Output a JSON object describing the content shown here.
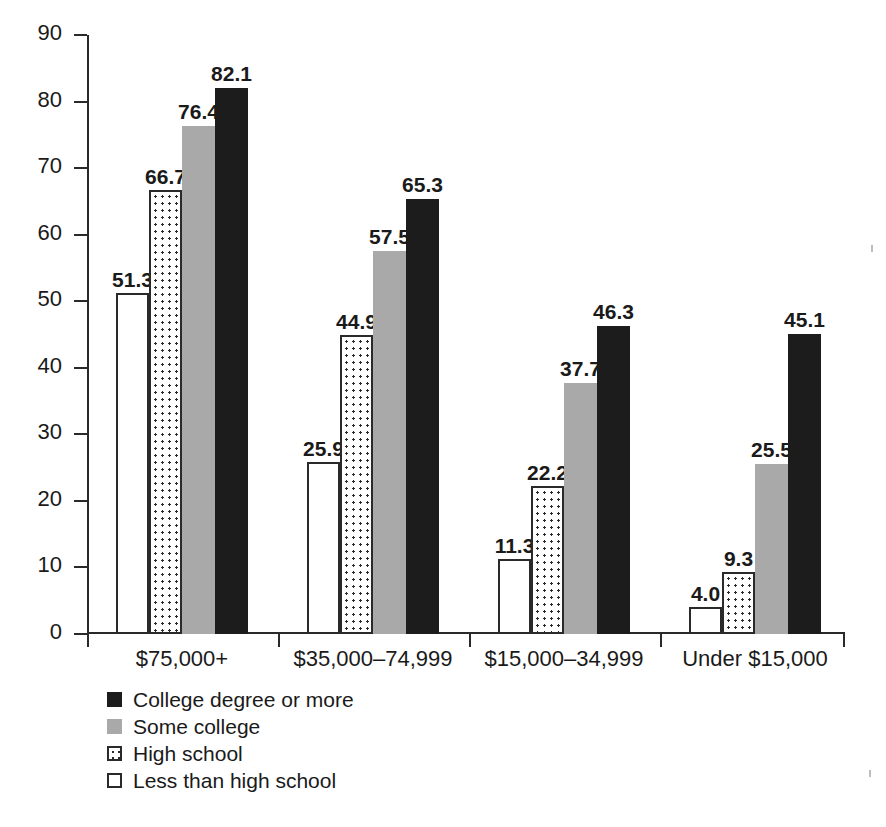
{
  "chart_data": {
    "type": "bar",
    "title": "",
    "subtitle": "",
    "xlabel": "",
    "ylabel": "",
    "ylim": [
      0,
      90
    ],
    "yticks": [
      0,
      10,
      20,
      30,
      40,
      50,
      60,
      70,
      80,
      90
    ],
    "grid": false,
    "legend_position": "bottom-left",
    "categories": [
      "$75,000+",
      "$35,000–74,999",
      "$15,000–34,999",
      "Under $15,000"
    ],
    "series": [
      {
        "name": "Less than high school",
        "swatch": "white-outline",
        "color": "#ffffff",
        "values": [
          51.3,
          25.9,
          11.3,
          4.0
        ],
        "labels": [
          "51.3",
          "25.9",
          "11.3",
          "4.0"
        ]
      },
      {
        "name": "High school",
        "swatch": "dotted",
        "color": "#ffffff",
        "values": [
          66.7,
          44.9,
          22.2,
          9.3
        ],
        "labels": [
          "66.7",
          "44.9",
          "22.2",
          "9.3"
        ]
      },
      {
        "name": "Some college",
        "swatch": "gray",
        "color": "#a9a9a9",
        "values": [
          76.4,
          57.5,
          37.7,
          25.5
        ],
        "labels": [
          "76.4",
          "57.5",
          "37.7",
          "25.5"
        ]
      },
      {
        "name": "College degree or more",
        "swatch": "black",
        "color": "#1c1c1c",
        "values": [
          82.1,
          65.3,
          46.3,
          45.1
        ],
        "labels": [
          "82.1",
          "65.3",
          "46.3",
          "45.1"
        ]
      }
    ],
    "legend_order": [
      "College degree or more",
      "Some college",
      "High school",
      "Less than high school"
    ]
  },
  "axis": {
    "y": {
      "ticks": [
        {
          "label": "90"
        },
        {
          "label": "80"
        },
        {
          "label": "70"
        },
        {
          "label": "60"
        },
        {
          "label": "50"
        },
        {
          "label": "40"
        },
        {
          "label": "30"
        },
        {
          "label": "20"
        },
        {
          "label": "10"
        },
        {
          "label": "0"
        }
      ]
    }
  },
  "legend": {
    "items": [
      {
        "label": "College degree or more",
        "style": "fill-college"
      },
      {
        "label": "Some college",
        "style": "fill-some"
      },
      {
        "label": "High school",
        "style": "fill-hs"
      },
      {
        "label": "Less than high school",
        "style": "fill-less"
      }
    ]
  }
}
